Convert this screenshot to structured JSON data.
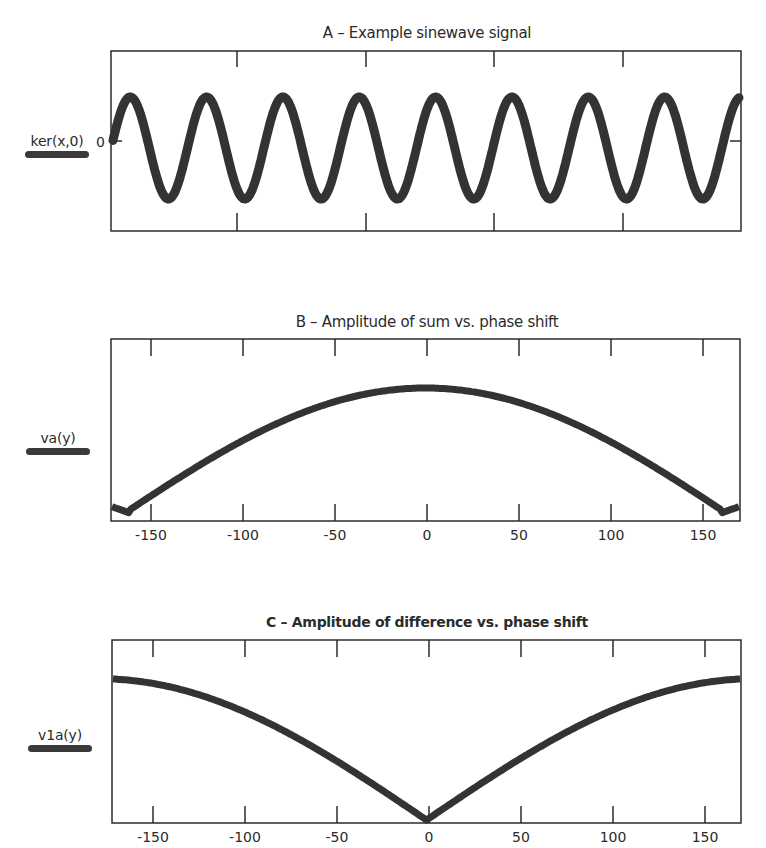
{
  "figure": {
    "panels": [
      {
        "id": "A",
        "title": "A – Example sinewave signal",
        "legend_label": "ker(x,0)",
        "y_tick_label": "0"
      },
      {
        "id": "B",
        "title": "B – Amplitude of sum vs. phase shift",
        "legend_label": "va(y)",
        "x_tick_labels": [
          "-150",
          "-100",
          "-50",
          "0",
          "50",
          "100",
          "150"
        ]
      },
      {
        "id": "C",
        "title": "C – Amplitude of difference vs. phase shift",
        "legend_label": "v1a(y)",
        "x_tick_labels": [
          "-150",
          "-100",
          "-50",
          "0",
          "50",
          "100",
          "150"
        ]
      }
    ],
    "colors": {
      "line": "#333333",
      "axis": "#2b2b2b",
      "background": "#ffffff"
    }
  },
  "chart_data": [
    {
      "type": "line",
      "title": "A – Example sinewave signal",
      "series": [
        {
          "name": "ker(x,0)",
          "function": "sin",
          "cycles": 8.2,
          "amplitude": 1,
          "x": [
            0,
            1,
            2,
            3,
            4,
            5,
            6,
            7,
            8
          ],
          "values": [
            0,
            0,
            0,
            0,
            0,
            0,
            0,
            0,
            0
          ]
        }
      ],
      "xlabel": "",
      "ylabel": "ker(x,0)",
      "y_ticks": [
        "0"
      ],
      "x_ticks_unlabeled": 4,
      "grid": false,
      "legend_position": "left"
    },
    {
      "type": "line",
      "title": "B – Amplitude of sum vs. phase shift",
      "categories": [
        "-172",
        "-162",
        "-150",
        "-100",
        "-50",
        "0",
        "50",
        "100",
        "150",
        "162",
        "172"
      ],
      "series": [
        {
          "name": "va(y)",
          "x": [
            -172,
            -162,
            -150,
            -100,
            -50,
            0,
            50,
            100,
            150,
            162,
            172
          ],
          "values": [
            0.08,
            0.03,
            0.17,
            0.57,
            0.86,
            1.0,
            0.86,
            0.57,
            0.17,
            0.03,
            0.08
          ]
        }
      ],
      "xlabel": "",
      "ylabel": "va(y)",
      "x_tick_labels": [
        "-150",
        "-100",
        "-50",
        "0",
        "50",
        "100",
        "150"
      ],
      "xlim": [
        -172,
        172
      ],
      "ylim": [
        0,
        1.05
      ],
      "grid": false,
      "legend_position": "left"
    },
    {
      "type": "line",
      "title": "C – Amplitude of difference vs. phase shift",
      "series": [
        {
          "name": "v1a(y)",
          "x": [
            -172,
            -150,
            -100,
            -50,
            0,
            50,
            100,
            150,
            172
          ],
          "values": [
            1.0,
            0.96,
            0.87,
            0.62,
            0.0,
            0.62,
            0.87,
            0.96,
            1.0
          ]
        }
      ],
      "xlabel": "",
      "ylabel": "v1a(y)",
      "x_tick_labels": [
        "-150",
        "-100",
        "-50",
        "0",
        "50",
        "100",
        "150"
      ],
      "xlim": [
        -172,
        172
      ],
      "ylim": [
        0,
        1.1
      ],
      "grid": false,
      "legend_position": "left"
    }
  ]
}
